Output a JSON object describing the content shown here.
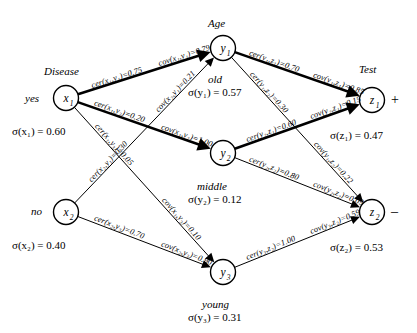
{
  "diagram": {
    "title": "",
    "type": "certainty-covering network",
    "groups": [
      {
        "id": "disease",
        "label": "Disease"
      },
      {
        "id": "age",
        "label": "Age"
      },
      {
        "id": "test",
        "label": "Test"
      }
    ],
    "nodes": [
      {
        "id": "x1",
        "symbol": "x",
        "index": "1",
        "side_label": "yes",
        "state_label": "",
        "sigma_text": "σ(x₁) = 0.60",
        "sigma": 0.6,
        "cx": 66,
        "cy": 98
      },
      {
        "id": "x2",
        "symbol": "x",
        "index": "2",
        "side_label": "no",
        "state_label": "",
        "sigma_text": "σ(x₂) = 0.40",
        "sigma": 0.4,
        "cx": 66,
        "cy": 212
      },
      {
        "id": "y1",
        "symbol": "y",
        "index": "1",
        "side_label": "",
        "state_label": "old",
        "sigma_text": "σ(y₁) = 0.57",
        "sigma": 0.57,
        "cx": 223,
        "cy": 48
      },
      {
        "id": "y2",
        "symbol": "y",
        "index": "2",
        "side_label": "",
        "state_label": "middle",
        "sigma_text": "σ(y₂) = 0.12",
        "sigma": 0.12,
        "cx": 223,
        "cy": 153
      },
      {
        "id": "y3",
        "symbol": "y",
        "index": "3",
        "side_label": "",
        "state_label": "young",
        "sigma_text": "σ(y₃) = 0.31",
        "sigma": 0.31,
        "cx": 223,
        "cy": 272
      },
      {
        "id": "z1",
        "symbol": "z",
        "index": "1",
        "side_label": "+",
        "state_label": "",
        "sigma_text": "σ(z₁) = 0.47",
        "sigma": 0.47,
        "cx": 372,
        "cy": 100
      },
      {
        "id": "z2",
        "symbol": "z",
        "index": "2",
        "side_label": "–",
        "state_label": "",
        "sigma_text": "σ(z₂) = 0.53",
        "sigma": 0.53,
        "cx": 372,
        "cy": 212
      }
    ],
    "edges": [
      {
        "from": "x1",
        "to": "y1",
        "cer_text": "cer(x₁,y₁)=0.75",
        "cer": 0.75,
        "cov_text": "cov(x₁,y₁)=0.79",
        "cov": 0.79,
        "weight": "thick"
      },
      {
        "from": "x1",
        "to": "y2",
        "cer_text": "cer(x₁,y₂)=0.20",
        "cer": 0.2,
        "cov_text": "cov(x₁,y₂)=1.00",
        "cov": 1.0,
        "weight": "thick"
      },
      {
        "from": "x1",
        "to": "y3",
        "cer_text": "cer(x₁,y₃)=0.05",
        "cer": 0.05,
        "cov_text": "cov(x₁,y₃)=0.10",
        "cov": 0.1,
        "weight": "thin"
      },
      {
        "from": "x2",
        "to": "y1",
        "cer_text": "cer(x₂,y₁)=0.30",
        "cer": 0.3,
        "cov_text": "cov(x₂,y₁)=0.21",
        "cov": 0.21,
        "weight": "thin"
      },
      {
        "from": "x2",
        "to": "y3",
        "cer_text": "cer(x₂,y₃)=0.70",
        "cer": 0.7,
        "cov_text": "cov(x₂,y₃)=0.90",
        "cov": 0.9,
        "weight": "thin"
      },
      {
        "from": "y1",
        "to": "z1",
        "cer_text": "cer(y₁,z₁)=0.70",
        "cer": 0.7,
        "cov_text": "cov(y₁,z₁)=0.85",
        "cov": 0.85,
        "weight": "thick"
      },
      {
        "from": "y1",
        "to": "z2",
        "cer_text": "cer(y₁,z₂)=0.30",
        "cer": 0.3,
        "cov_text": "cov(y₁,z₂)=0.22",
        "cov": 0.22,
        "weight": "thin"
      },
      {
        "from": "y2",
        "to": "z1",
        "cer_text": "cer(y₂,z₁)=0.60",
        "cer": 0.6,
        "cov_text": "cov(y₂,z₁)=0.15",
        "cov": 0.15,
        "weight": "thick"
      },
      {
        "from": "y2",
        "to": "z2",
        "cer_text": "cer(y₂,z₂)=0.80",
        "cer": 0.8,
        "cov_text": "cov(y₂,z₂)=0.09",
        "cov": 0.09,
        "weight": "thin"
      },
      {
        "from": "y3",
        "to": "z2",
        "cer_text": "cer(y₃,z₂)=1.00",
        "cer": 1.0,
        "cov_text": "cov(y₃,z₂)=0.59",
        "cov": 0.59,
        "weight": "thin"
      }
    ],
    "node_text": {
      "x1": "x₁",
      "x2": "x₂",
      "y1": "y₁",
      "y2": "y₂",
      "y3": "y₃",
      "z1": "z₁",
      "z2": "z₂"
    },
    "colors": {
      "stroke": "#000000",
      "background": "#ffffff",
      "node_fill": "#ffffff"
    }
  }
}
